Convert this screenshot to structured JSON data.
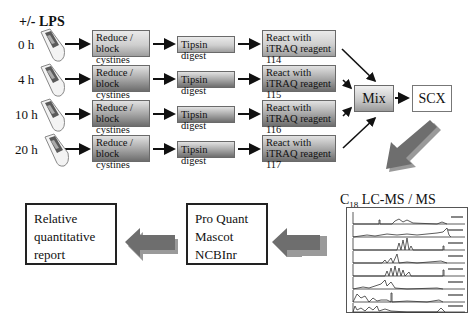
{
  "title": "+/- LPS",
  "timepoints": [
    {
      "label": "0 h",
      "reduce": [
        "Reduce /",
        "block cystines"
      ],
      "digest": "Tipsin digest",
      "react": [
        "React with",
        "iTRAQ reagent 114"
      ]
    },
    {
      "label": "4 h",
      "reduce": [
        "Reduce /",
        "block cystines"
      ],
      "digest": "Tipsin digest",
      "react": [
        "React with",
        "iTRAQ reagent 115"
      ]
    },
    {
      "label": "10 h",
      "reduce": [
        "Reduce /",
        "block cystines"
      ],
      "digest": "Tipsin digest",
      "react": [
        "React with",
        "iTRAQ reagent 116"
      ]
    },
    {
      "label": "20 h",
      "reduce": [
        "Reduce /",
        "block cystines"
      ],
      "digest": "Tipsin digest",
      "react": [
        "React with",
        "iTRAQ reagent 117"
      ]
    }
  ],
  "mix": "Mix",
  "scx": "SCX",
  "lcms": {
    "prefix": "C",
    "subscript": "18",
    "suffix": " LC-MS / MS",
    "trace_count": 8
  },
  "software_box": [
    "Pro Quant",
    "Mascot",
    "NCBInr"
  ],
  "report_box": [
    "Relative",
    "quantitative",
    "report"
  ],
  "colors": {
    "arrow_fill": "#6e6e6e",
    "arrow_shadow": "#9a9a9a",
    "box_border": "#222222",
    "line": "#111111"
  }
}
